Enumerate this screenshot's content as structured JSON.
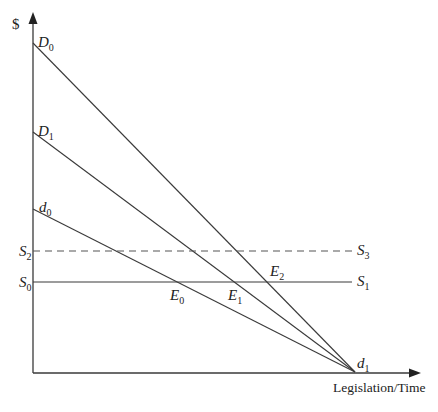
{
  "axes": {
    "y_label": "$",
    "x_label": "Legislation/Time"
  },
  "lines": {
    "D0": {
      "label_main": "D",
      "label_sub": "0"
    },
    "D1": {
      "label_main": "D",
      "label_sub": "1"
    },
    "d0": {
      "label_main": "d",
      "label_sub": "0"
    },
    "d1": {
      "label_main": "d",
      "label_sub": "1"
    },
    "S0": {
      "label_main": "S",
      "label_sub": "0"
    },
    "S1": {
      "label_main": "S",
      "label_sub": "1"
    },
    "S2": {
      "label_main": "S",
      "label_sub": "2"
    },
    "S3": {
      "label_main": "S",
      "label_sub": "3"
    }
  },
  "points": {
    "E0": {
      "label_main": "E",
      "label_sub": "0"
    },
    "E1": {
      "label_main": "E",
      "label_sub": "1"
    },
    "E2": {
      "label_main": "E",
      "label_sub": "2"
    }
  },
  "colors": {
    "line": "#3a3a3a",
    "text": "#222222",
    "background": "#ffffff"
  }
}
